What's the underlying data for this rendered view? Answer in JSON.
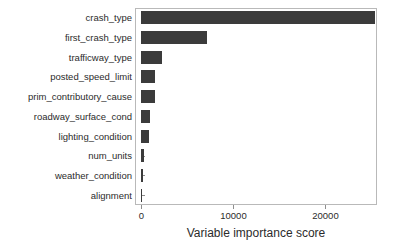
{
  "chart_data": {
    "type": "bar",
    "orientation": "horizontal",
    "title": "",
    "xlabel": "Variable importance score",
    "ylabel": "",
    "categories": [
      "crash_type",
      "first_crash_type",
      "trafficway_type",
      "posted_speed_limit",
      "prim_contributory_cause",
      "roadway_surface_cond",
      "lighting_condition",
      "num_units",
      "weather_condition",
      "alignment"
    ],
    "values": [
      25400,
      7100,
      2250,
      1500,
      1450,
      880,
      780,
      330,
      200,
      30
    ],
    "xlim": [
      -700,
      25600
    ],
    "ylim": [
      0,
      10
    ],
    "xticks": [
      0,
      10000,
      20000
    ],
    "xticklabels": [
      "0",
      "10000",
      "20000"
    ],
    "grid": false,
    "legend": null,
    "bar_color": "#3b3b3b",
    "panel_border_color": "#b9b9b9",
    "background_color": "#ffffff"
  }
}
